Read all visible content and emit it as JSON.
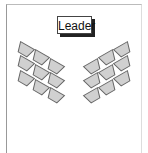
{
  "diagram": {
    "leader_label": "Leader",
    "seat_fill": "#d0d0d0",
    "seat_stroke": "#666666",
    "left_seats": [
      {
        "x": 25,
        "y": 50
      },
      {
        "x": 40,
        "y": 58
      },
      {
        "x": 55,
        "y": 67
      },
      {
        "x": 25,
        "y": 64
      },
      {
        "x": 40,
        "y": 73
      },
      {
        "x": 55,
        "y": 81
      },
      {
        "x": 25,
        "y": 79
      },
      {
        "x": 40,
        "y": 88
      },
      {
        "x": 55,
        "y": 96
      }
    ],
    "right_seats": [
      {
        "x": 123,
        "y": 50
      },
      {
        "x": 108,
        "y": 58
      },
      {
        "x": 93,
        "y": 67
      },
      {
        "x": 123,
        "y": 64
      },
      {
        "x": 108,
        "y": 73
      },
      {
        "x": 93,
        "y": 81
      },
      {
        "x": 123,
        "y": 79
      },
      {
        "x": 108,
        "y": 88
      },
      {
        "x": 93,
        "y": 96
      }
    ]
  }
}
